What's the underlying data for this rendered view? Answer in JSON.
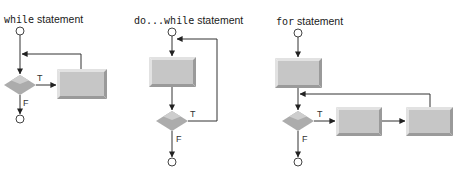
{
  "colors": {
    "line": "#333333",
    "process_face": "#c6c6c6",
    "process_light": "#e2e2e2",
    "process_dark": "#9a9a9a",
    "decision_fill": "#acacac",
    "decision_light": "#cdcdcd"
  },
  "diagrams": [
    {
      "id": "while",
      "keyword": "while",
      "title_suffix": " statement",
      "true_label": "T",
      "false_label": "F",
      "process_boxes": 1
    },
    {
      "id": "do-while",
      "keyword": "do...while",
      "title_suffix": " statement",
      "true_label": "T",
      "false_label": "F",
      "process_boxes": 1
    },
    {
      "id": "for",
      "keyword": "for",
      "title_suffix": " statement",
      "true_label": "T",
      "false_label": "F",
      "process_boxes": 3
    }
  ]
}
